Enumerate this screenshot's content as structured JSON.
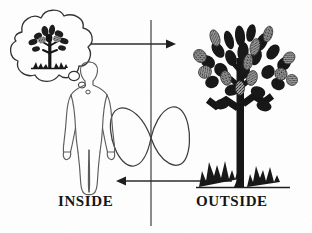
{
  "figure": {
    "background_color": "#ffffff",
    "ink_color": "#1a1a1a",
    "width": 312,
    "height": 233
  },
  "labels": {
    "inside": "INSIDE",
    "outside": "OUTSIDE"
  },
  "divider": {
    "name": "vertical-divider-line",
    "x": 151,
    "y_top": 20,
    "y_bottom": 226,
    "color": "#4a4a4a"
  },
  "arrows": [
    {
      "name": "arrow-inside-to-outside",
      "direction": "right",
      "x_start": 78,
      "x_end": 173,
      "y": 44,
      "color": "#2a2a2a"
    },
    {
      "name": "arrow-outside-to-inside",
      "direction": "left",
      "x_start": 232,
      "x_end": 118,
      "y": 181,
      "color": "#2a2a2a"
    }
  ],
  "lemniscate": {
    "name": "infinity-loop",
    "center_x": 151,
    "center_y": 138,
    "half_width": 40,
    "half_height": 34,
    "color": "#3a3a3a"
  },
  "thought_bubble": {
    "name": "thought-bubble-with-tree",
    "center_x": 50,
    "center_y": 50,
    "radius_x": 42,
    "radius_y": 40,
    "trail_count": 3,
    "contains": "imagined-tree"
  },
  "human_figure": {
    "name": "human-figure-outline",
    "center_x": 89,
    "top_y": 62,
    "bottom_y": 190,
    "pose": "standing-front-view",
    "stroke_color": "#555555"
  },
  "outside_tree": {
    "name": "outside-tree",
    "trunk_x": 240,
    "trunk_top_y": 60,
    "trunk_bottom_y": 186,
    "canopy_top_y": 28,
    "leaf_count": 26,
    "grass_tufts": 2,
    "leaf_dark_color": "#161616",
    "leaf_light_color": "#8e8e8e",
    "ground_y": 187
  },
  "inside_tree": {
    "name": "imagined-tree",
    "trunk_x": 50,
    "trunk_top_y": 36,
    "trunk_bottom_y": 70,
    "leaf_count": 14
  }
}
